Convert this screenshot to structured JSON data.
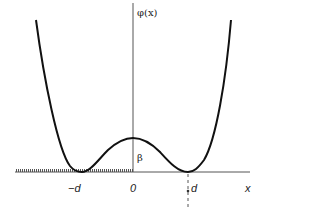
{
  "diagram": {
    "y_axis_label": "φ(x)",
    "x_axis_label": "x",
    "barrier_label": "β",
    "ticks": {
      "neg_d": "−d",
      "zero": "0",
      "pos_d": "d"
    },
    "colors": {
      "curve": "#111111",
      "axis": "#555555",
      "hatch": "#555555",
      "text": "#222222"
    }
  }
}
